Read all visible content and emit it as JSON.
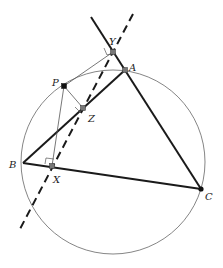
{
  "diagram": {
    "circle": {
      "cx": 113,
      "cy": 162,
      "r": 92,
      "stroke": "#555555"
    },
    "points": {
      "A": {
        "x": 125,
        "y": 70,
        "label": "A",
        "lx": 130,
        "ly": 70
      },
      "B": {
        "x": 23,
        "y": 163,
        "label": "B",
        "lx": 10,
        "ly": 167
      },
      "C": {
        "x": 201,
        "y": 189,
        "label": "C",
        "lx": 206,
        "ly": 199
      },
      "P": {
        "x": 64,
        "y": 86,
        "label": "P",
        "lx": 52,
        "ly": 85
      },
      "X": {
        "x": 52,
        "y": 166,
        "label": "X",
        "lx": 54,
        "ly": 182
      },
      "Y": {
        "x": 113,
        "y": 52,
        "label": "Y",
        "lx": 110,
        "ly": 44
      },
      "Z": {
        "x": 83,
        "y": 108,
        "label": "Z",
        "lx": 89,
        "ly": 121
      }
    },
    "labels": {
      "A": "A",
      "B": "B",
      "C": "C",
      "P": "P",
      "X": "X",
      "Y": "Y",
      "Z": "Z"
    },
    "colors": {
      "triangle": "#1a1a1a",
      "thin": "#555555",
      "dashed": "#1a1a1a",
      "point_fill": "#777777",
      "p_fill": "#111111"
    }
  }
}
